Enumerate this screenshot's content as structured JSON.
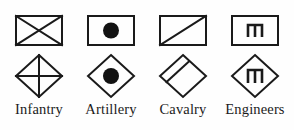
{
  "figure": {
    "kind": "military-map-symbol-legend",
    "background_color": "#fefefe",
    "ink_color": "#1a1a1a",
    "rows": [
      {
        "name": "boxed-unit-symbols",
        "shape": "rectangle"
      },
      {
        "name": "diamond-unit-symbols",
        "shape": "diamond"
      },
      {
        "name": "labels",
        "shape": "text"
      }
    ]
  },
  "units": [
    {
      "label": "Infantry",
      "rect_icon": "crossed-rectangle-icon",
      "diamond_icon": "crossed-diamond-icon",
      "interior_marking": "saltire-cross"
    },
    {
      "label": "Artillery",
      "rect_icon": "dot-rectangle-icon",
      "diamond_icon": "dot-diamond-icon",
      "interior_marking": "filled-circle"
    },
    {
      "label": "Cavalry",
      "rect_icon": "diagonal-rectangle-icon",
      "diamond_icon": "diagonal-diamond-icon",
      "interior_marking": "single-diagonal"
    },
    {
      "label": "Engineers",
      "rect_icon": "bridge-glyph-rectangle-icon",
      "diamond_icon": "bridge-glyph-diamond-icon",
      "interior_marking": "bridge-m-glyph"
    }
  ]
}
